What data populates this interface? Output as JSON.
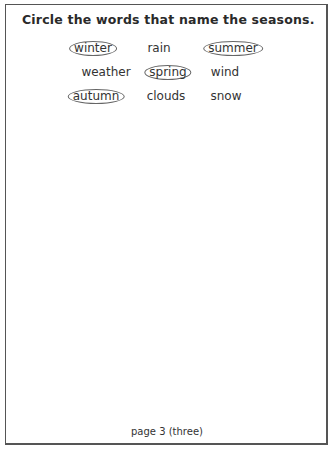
{
  "worksheet": {
    "instruction": "Circle the words that name the seasons.",
    "words": [
      {
        "text": "winter",
        "circled": true,
        "x": 93,
        "y": 40
      },
      {
        "text": "rain",
        "circled": false,
        "x": 159,
        "y": 40
      },
      {
        "text": "summer",
        "circled": true,
        "x": 233,
        "y": 40
      },
      {
        "text": "weather",
        "circled": false,
        "x": 106,
        "y": 64
      },
      {
        "text": "spring",
        "circled": true,
        "x": 168,
        "y": 64
      },
      {
        "text": "wind",
        "circled": false,
        "x": 225,
        "y": 64
      },
      {
        "text": "autumn",
        "circled": true,
        "x": 96,
        "y": 88
      },
      {
        "text": "clouds",
        "circled": false,
        "x": 166,
        "y": 88
      },
      {
        "text": "snow",
        "circled": false,
        "x": 226,
        "y": 88
      }
    ],
    "page_label": "page 3 (three)"
  }
}
